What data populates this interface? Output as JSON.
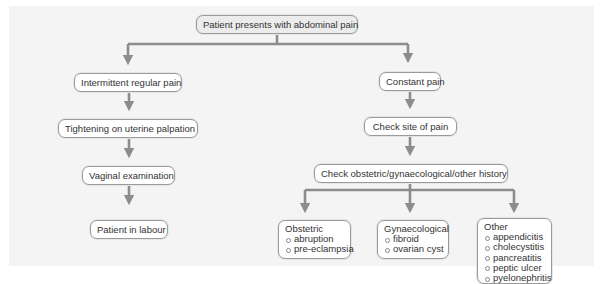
{
  "diagram": {
    "root": "Patient presents with abdominal pain",
    "left_branch": [
      "Intermittent regular pain",
      "Tightening on uterine palpation",
      "Vaginal examination",
      "Patient in labour"
    ],
    "right_branch": [
      "Constant pain",
      "Check site of pain",
      "Check obstetric/gynaecological/other history"
    ],
    "history_categories": [
      {
        "title": "Obstetric",
        "items": [
          "abruption",
          "pre-eclampsia"
        ]
      },
      {
        "title": "Gynaecological",
        "items": [
          "fibroid",
          "ovarian cyst"
        ]
      },
      {
        "title": "Other",
        "items": [
          "appendicitis",
          "cholecystitis",
          "pancreatitis",
          "peptic ulcer",
          "pyelonephritis"
        ]
      }
    ],
    "colors": {
      "connector": "#8c8c8c",
      "panel": "#f4f4f4",
      "node_border": "#9a9a9a"
    }
  }
}
